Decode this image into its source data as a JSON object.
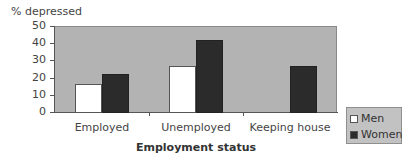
{
  "chart_data": {
    "type": "bar",
    "title": "",
    "xlabel": "Employment status",
    "ylabel": "% depressed",
    "ylim": [
      0,
      50
    ],
    "yticks": [
      0,
      10,
      20,
      30,
      40,
      50
    ],
    "categories": [
      "Employed",
      "Unemployed",
      "Keeping house"
    ],
    "series": [
      {
        "name": "Men",
        "color": "#ffffff",
        "values": [
          16,
          27,
          null
        ]
      },
      {
        "name": "Women",
        "color": "#2b2b2b",
        "values": [
          22,
          42,
          27
        ]
      }
    ],
    "grid": false,
    "plot_background": "#b3b3b3",
    "legend_position": "right-bottom"
  },
  "labels": {
    "ylabel": "% depressed",
    "xlabel": "Employment status",
    "yticks": [
      "50",
      "40",
      "30",
      "20",
      "10",
      "0"
    ],
    "categories": [
      "Employed",
      "Unemployed",
      "Keeping house"
    ],
    "legend": [
      "Men",
      "Women"
    ]
  }
}
